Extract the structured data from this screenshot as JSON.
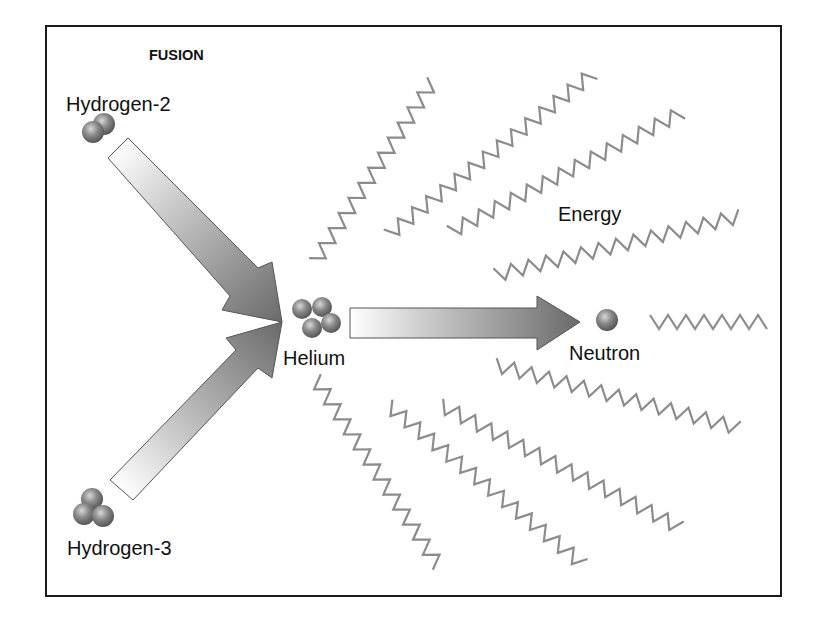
{
  "diagram": {
    "title": "FUSION",
    "labels": {
      "hydrogen2": "Hydrogen-2",
      "hydrogen3": "Hydrogen-3",
      "helium": "Helium",
      "neutron": "Neutron",
      "energy": "Energy"
    },
    "colors": {
      "frame": "#1a1a1a",
      "arrow_dark": "#6e6e6e",
      "arrow_light": "#f2f2f2",
      "wave": "#8c8c8c",
      "particle": "#7a7a7a",
      "text": "#111111"
    },
    "nodes": [
      {
        "id": "hydrogen-2",
        "label": "Hydrogen-2",
        "particles": 2
      },
      {
        "id": "hydrogen-3",
        "label": "Hydrogen-3",
        "particles": 3
      },
      {
        "id": "helium",
        "label": "Helium",
        "particles": 4
      },
      {
        "id": "neutron",
        "label": "Neutron",
        "particles": 1
      }
    ],
    "edges": [
      {
        "from": "hydrogen-2",
        "to": "helium"
      },
      {
        "from": "hydrogen-3",
        "to": "helium"
      },
      {
        "from": "helium",
        "to": "neutron"
      }
    ],
    "energy_waves": 9
  }
}
